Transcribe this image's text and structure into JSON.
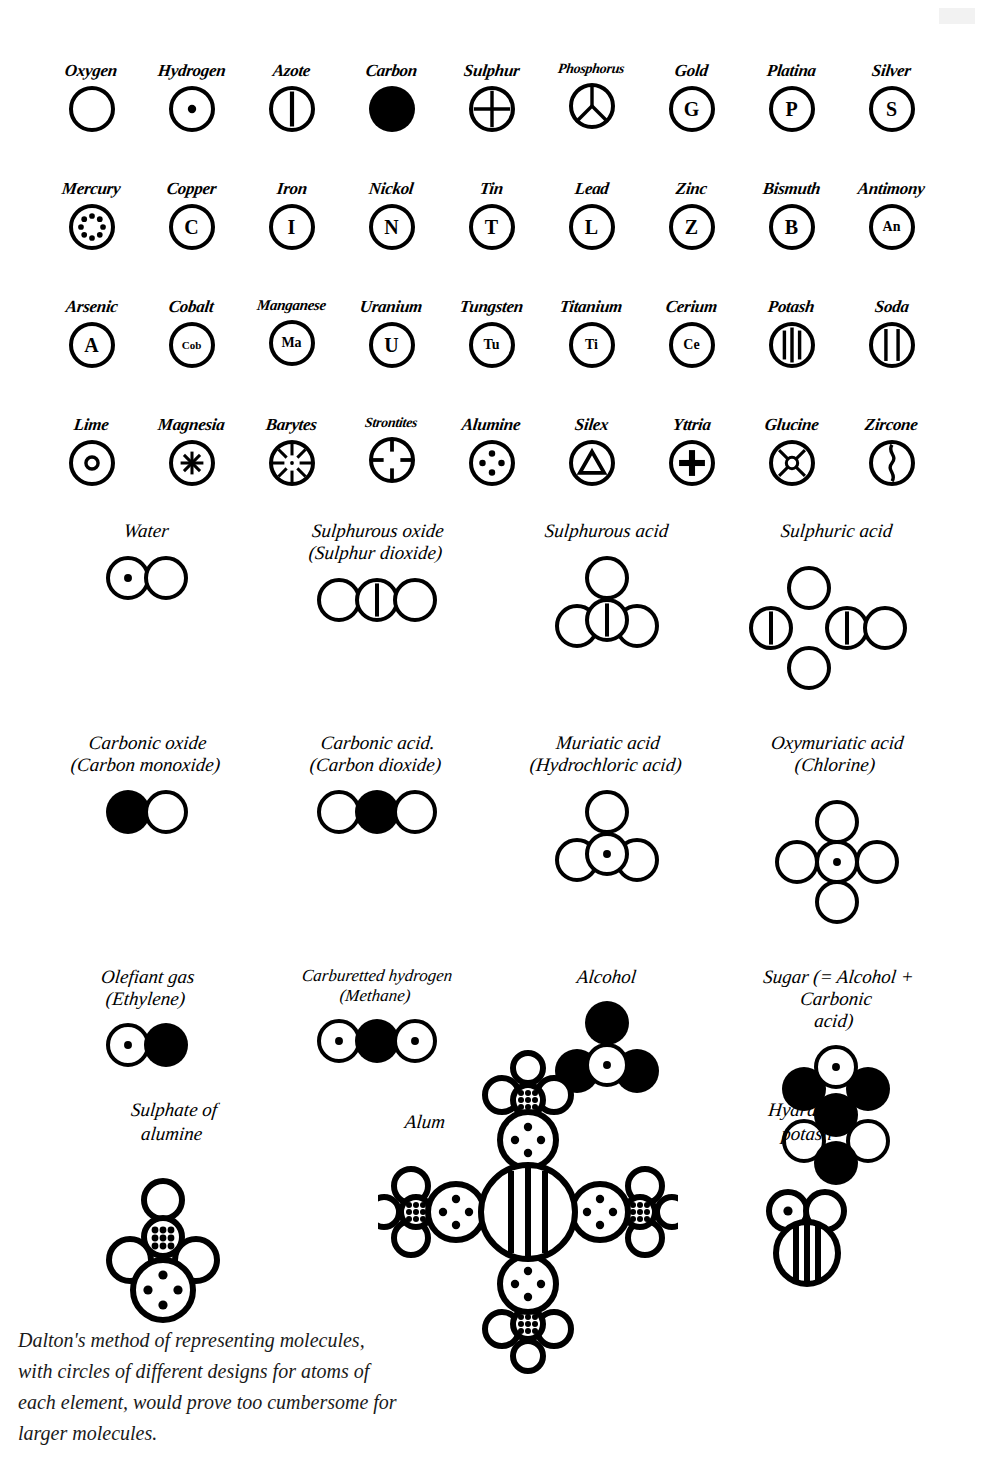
{
  "page": {
    "title": "Dalton's method of representing molecules",
    "background_color": "#ffffff",
    "ink_color": "#000000"
  },
  "element_rows": [
    {
      "row_index": 1,
      "elements": [
        {
          "name": "Oxygen",
          "symbol_style": "empty-circle",
          "label": ""
        },
        {
          "name": "Hydrogen",
          "symbol_style": "center-dot",
          "label": ""
        },
        {
          "name": "Azote",
          "symbol_style": "vertical-bar",
          "label": ""
        },
        {
          "name": "Carbon",
          "symbol_style": "filled-circle",
          "label": ""
        },
        {
          "name": "Sulphur",
          "symbol_style": "quartered-cross",
          "label": ""
        },
        {
          "name": "Phosphorus",
          "symbol_style": "y-spokes",
          "label": ""
        },
        {
          "name": "Gold",
          "symbol_style": "letter",
          "label": "G"
        },
        {
          "name": "Platina",
          "symbol_style": "letter",
          "label": "P"
        },
        {
          "name": "Silver",
          "symbol_style": "letter",
          "label": "S"
        }
      ]
    },
    {
      "row_index": 2,
      "elements": [
        {
          "name": "Mercury",
          "symbol_style": "ring-of-dots",
          "label": ""
        },
        {
          "name": "Copper",
          "symbol_style": "letter",
          "label": "C"
        },
        {
          "name": "Iron",
          "symbol_style": "letter",
          "label": "I"
        },
        {
          "name": "Nickol",
          "symbol_style": "letter",
          "label": "N"
        },
        {
          "name": "Tin",
          "symbol_style": "letter",
          "label": "T"
        },
        {
          "name": "Lead",
          "symbol_style": "letter",
          "label": "L"
        },
        {
          "name": "Zinc",
          "symbol_style": "letter",
          "label": "Z"
        },
        {
          "name": "Bismuth",
          "symbol_style": "letter",
          "label": "B"
        },
        {
          "name": "Antimony",
          "symbol_style": "letter",
          "label": "An"
        }
      ]
    },
    {
      "row_index": 3,
      "elements": [
        {
          "name": "Arsenic",
          "symbol_style": "letter",
          "label": "A"
        },
        {
          "name": "Cobalt",
          "symbol_style": "letter",
          "label": "Cob"
        },
        {
          "name": "Manganese",
          "symbol_style": "letter",
          "label": "Ma"
        },
        {
          "name": "Uranium",
          "symbol_style": "letter",
          "label": "U"
        },
        {
          "name": "Tungsten",
          "symbol_style": "letter",
          "label": "Tu"
        },
        {
          "name": "Titanium",
          "symbol_style": "letter",
          "label": "Ti"
        },
        {
          "name": "Cerium",
          "symbol_style": "letter",
          "label": "Ce"
        },
        {
          "name": "Potash",
          "symbol_style": "three-bars",
          "label": ""
        },
        {
          "name": "Soda",
          "symbol_style": "two-bars",
          "label": ""
        }
      ]
    },
    {
      "row_index": 4,
      "elements": [
        {
          "name": "Lime",
          "symbol_style": "small-ring",
          "label": ""
        },
        {
          "name": "Magnesia",
          "symbol_style": "asterisk",
          "label": ""
        },
        {
          "name": "Barytes",
          "symbol_style": "radial-spokes",
          "label": ""
        },
        {
          "name": "Strontites",
          "symbol_style": "four-inward-ticks",
          "label": ""
        },
        {
          "name": "Alumine",
          "symbol_style": "four-dots",
          "label": ""
        },
        {
          "name": "Silex",
          "symbol_style": "triangle",
          "label": ""
        },
        {
          "name": "Yttria",
          "symbol_style": "plus",
          "label": ""
        },
        {
          "name": "Glucine",
          "symbol_style": "diagonal-diamond",
          "label": ""
        },
        {
          "name": "Zircone",
          "symbol_style": "wavy-divider",
          "label": ""
        }
      ]
    }
  ],
  "compound_rows": [
    {
      "row_index": 1,
      "compounds": [
        {
          "name_lines": [
            "Water"
          ],
          "layout": "linear",
          "atoms": [
            "hydrogen",
            "oxygen"
          ]
        },
        {
          "name_lines": [
            "Sulphurous oxide",
            "(Sulphur dioxide)"
          ],
          "layout": "linear",
          "atoms": [
            "oxygen",
            "azote-bar",
            "oxygen"
          ]
        },
        {
          "name_lines": [
            "Sulphurous acid"
          ],
          "layout": "triangle",
          "atoms": [
            "oxygen-top",
            "azote-bar-center",
            "oxygen-left",
            "oxygen-right"
          ]
        },
        {
          "name_lines": [
            "Sulphuric acid"
          ],
          "layout": "sulphuric",
          "atoms": [
            "bar-left",
            "oxygen-top",
            "oxygen-bottom",
            "bar-center",
            "oxygen-right"
          ]
        }
      ]
    },
    {
      "row_index": 2,
      "compounds": [
        {
          "name_lines": [
            "Carbonic oxide",
            "(Carbon monoxide)"
          ],
          "layout": "linear",
          "atoms": [
            "carbon",
            "oxygen"
          ]
        },
        {
          "name_lines": [
            "Carbonic acid.",
            "(Carbon dioxide)"
          ],
          "layout": "linear",
          "atoms": [
            "oxygen",
            "carbon",
            "oxygen"
          ]
        },
        {
          "name_lines": [
            "Muriatic acid",
            "(Hydrochloric acid)"
          ],
          "layout": "triangle",
          "atoms": [
            "oxygen-top",
            "hydrogen-center",
            "oxygen-left",
            "oxygen-right"
          ]
        },
        {
          "name_lines": [
            "Oxymuriatic acid",
            "(Chlorine)"
          ],
          "layout": "cross",
          "atoms": [
            "hydrogen-center",
            "oxygen-top",
            "oxygen-bottom",
            "oxygen-left",
            "oxygen-right"
          ]
        }
      ]
    },
    {
      "row_index": 3,
      "compounds": [
        {
          "name_lines": [
            "Olefiant gas",
            "(Ethylene)"
          ],
          "layout": "linear",
          "atoms": [
            "hydrogen",
            "carbon"
          ]
        },
        {
          "name_lines": [
            "Carburetted hydrogen",
            "(Methane)"
          ],
          "layout": "linear",
          "atoms": [
            "hydrogen",
            "carbon",
            "hydrogen"
          ]
        },
        {
          "name_lines": [
            "Alcohol"
          ],
          "layout": "triangle",
          "atoms": [
            "carbon-top",
            "hydrogen-center",
            "carbon-left",
            "carbon-right"
          ]
        },
        {
          "name_lines": [
            "Sugar (= Alcohol +",
            "Carbonic",
            "acid)"
          ],
          "layout": "hex",
          "atoms": [
            "hydrogen-top",
            "carbon-upper-left",
            "carbon-upper-right",
            "oxygen-lower-left",
            "oxygen-lower-right",
            "carbon-bottom",
            "carbon-center"
          ]
        }
      ]
    }
  ],
  "bottom_compounds": [
    {
      "name_lines": [
        "Sulphate of",
        "alumine"
      ],
      "layout": "sulphate-of-alumine"
    },
    {
      "name_lines": [
        "Alum"
      ],
      "layout": "alum"
    },
    {
      "name_lines": [
        "Hydrate of",
        "potash"
      ],
      "layout": "hydrate-of-potash"
    }
  ],
  "caption": {
    "lines": [
      "Dalton's method of representing molecules,",
      "with circles of different designs for atoms of",
      "each element, would prove too cumbersome for",
      "larger molecules."
    ],
    "text": "Dalton's method of representing molecules, with circles of different designs for atoms of each element, would prove too cumbersome for larger molecules."
  }
}
